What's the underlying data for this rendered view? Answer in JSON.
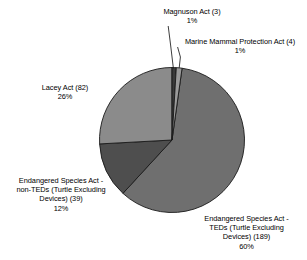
{
  "chart_data": {
    "type": "pie",
    "title": "",
    "subtitle": "",
    "xlabel": "",
    "ylabel": "",
    "legend_position": "none",
    "grid": false,
    "total_count": 317,
    "categories": [
      "Magnuson Act",
      "Marine Mammal Protection Act",
      "Endangered Species Act - TEDs (Turtle Excluding Devices)",
      "Endangered Species Act - non-TEDs (Turtle Excluding Devices)",
      "Lacey Act"
    ],
    "values": [
      3,
      4,
      189,
      39,
      82
    ],
    "percentages": [
      1,
      1,
      60,
      12,
      26
    ],
    "slices": [
      {
        "key": "magnuson",
        "name": "Magnuson Act",
        "count": 3,
        "value_label": "Magnuson Act (3)",
        "percent": 1,
        "percent_label": "1%",
        "color": "#3a3a3a",
        "start_angle": 0.0,
        "end_angle": 3.4
      },
      {
        "key": "marine_mammal",
        "name": "Marine Mammal Protection Act",
        "count": 4,
        "value_label": "Marine Mammal Protection Act (4)",
        "percent": 1,
        "percent_label": "1%",
        "color": "#9a9a9a",
        "start_angle": 3.4,
        "end_angle": 8.0
      },
      {
        "key": "esa_teds",
        "name": "Endangered Species Act - TEDs (Turtle Excluding Devices)",
        "count": 189,
        "value_label": "Devices) (189)",
        "percent": 60,
        "percent_label": "60%",
        "color": "#6f6f6f",
        "start_angle": 8.0,
        "end_angle": 222.6
      },
      {
        "key": "esa_nonteds",
        "name": "Endangered Species Act - non-TEDs (Turtle Excluding Devices)",
        "count": 39,
        "value_label": "Devices) (39)",
        "percent": 12,
        "percent_label": "12%",
        "color": "#4e4e4e",
        "start_angle": 222.6,
        "end_angle": 266.9
      },
      {
        "key": "lacey",
        "name": "Lacey Act",
        "count": 82,
        "value_label": "Lacey Act (82)",
        "percent": 26,
        "percent_label": "26%",
        "color": "#8b8b8b",
        "start_angle": 266.9,
        "end_angle": 360.0
      }
    ]
  },
  "labels": {
    "magnuson": {
      "line1": "Magnuson Act (3)",
      "percent": "1%"
    },
    "marine_mammal": {
      "line1": "Marine Mammal Protection Act (4)",
      "percent": "1%"
    },
    "lacey": {
      "line1": "Lacey Act (82)",
      "percent": "26%"
    },
    "esa_nonteds": {
      "line1": "Endangered Species Act -",
      "line2": "non-TEDs (Turtle Excluding",
      "line3": "Devices) (39)",
      "percent": "12%"
    },
    "esa_teds": {
      "line1": "Endangered Species Act -",
      "line2": "TEDs (Turtle Excluding",
      "line3": "Devices) (189)",
      "percent": "60%"
    }
  },
  "colors": {
    "background": "#ffffff",
    "text": "#000000",
    "slice_outline": "#1a1a1a",
    "leader_line": "#1a1a1a"
  }
}
